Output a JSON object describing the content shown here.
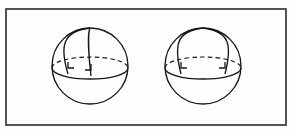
{
  "figure": {
    "width": 292,
    "height": 131,
    "background_color": "#ffffff",
    "ink_color": "#171717",
    "frame": {
      "name": "figure-border",
      "color": "#2b2b2b",
      "x": 6,
      "y": 9,
      "width": 280,
      "height": 116,
      "stroke_width": 1.6
    },
    "spheres": [
      {
        "id": "left-sphere",
        "label": "Left sphere",
        "center_x": 90,
        "center_y": 66,
        "radius": 38,
        "pole_x": 90,
        "pole_y": 28,
        "equator_rx": 38,
        "equator_ry": 11,
        "equator_cy": 68,
        "meridians": [
          {
            "id": "left-sphere-meridian-1",
            "label": "narrow meridian arc",
            "foot_x": 68,
            "foot_y": 74,
            "bulge_x": 60,
            "bulge_y": 47
          },
          {
            "id": "left-sphere-meridian-2",
            "label": "near-vertical meridian arc",
            "foot_x": 91,
            "foot_y": 76,
            "bulge_x": 88,
            "bulge_y": 50
          }
        ],
        "right_angles": [
          {
            "id": "left-sphere-right-angle-1",
            "x": 68,
            "y": 68,
            "size": 6
          },
          {
            "id": "left-sphere-right-angle-2",
            "x": 91,
            "y": 70,
            "size": 6
          }
        ]
      },
      {
        "id": "right-sphere",
        "label": "Right sphere",
        "center_x": 203,
        "center_y": 66,
        "radius": 38,
        "pole_x": 203,
        "pole_y": 28,
        "equator_rx": 38,
        "equator_ry": 11,
        "equator_cy": 68,
        "meridians": [
          {
            "id": "right-sphere-meridian-1",
            "label": "left meridian arc",
            "foot_x": 181,
            "foot_y": 74,
            "bulge_x": 174,
            "bulge_y": 46
          },
          {
            "id": "right-sphere-meridian-2",
            "label": "right meridian arc",
            "foot_x": 225,
            "foot_y": 74,
            "bulge_x": 232,
            "bulge_y": 46
          }
        ],
        "right_angles": [
          {
            "id": "right-sphere-right-angle-1",
            "x": 181,
            "y": 68,
            "size": 6
          },
          {
            "id": "right-sphere-right-angle-2",
            "x": 225,
            "y": 68,
            "size": 6
          }
        ]
      }
    ]
  }
}
